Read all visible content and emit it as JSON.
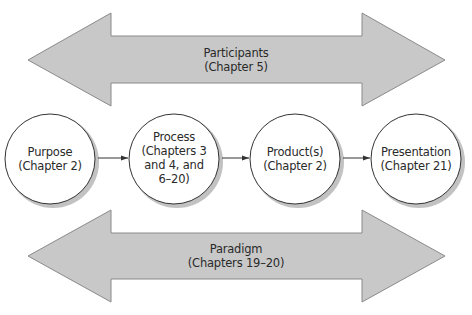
{
  "diagram": {
    "top_arrow": {
      "title": "Participants",
      "subtitle": "(Chapter 5)"
    },
    "nodes": [
      {
        "title": "Purpose",
        "lines": [
          "(Chapter 2)"
        ]
      },
      {
        "title": "Process",
        "lines": [
          "(Chapters 3",
          "and 4, and",
          "6–20)"
        ]
      },
      {
        "title": "Product(s)",
        "lines": [
          "(Chapter 2)"
        ]
      },
      {
        "title": "Presentation",
        "lines": [
          "(Chapter 21)"
        ]
      }
    ],
    "bottom_arrow": {
      "title": "Paradigm",
      "subtitle": "(Chapters 19–20)"
    },
    "colors": {
      "arrow_fill": "#c8c8c8",
      "arrow_stroke": "#8a8a8a",
      "circle_fill": "#ffffff",
      "circle_stroke": "#333333",
      "shadow": "#9a9a9a",
      "connector": "#333333"
    }
  }
}
